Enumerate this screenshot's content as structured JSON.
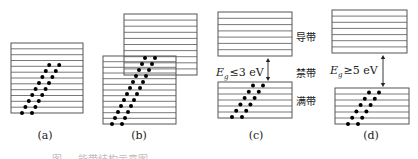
{
  "figure": {
    "line_color": "#555555",
    "dot_color": "#000000",
    "text_color": "#1a1a1a",
    "panels": [
      {
        "id": "a",
        "label": "(a)",
        "kind": "partially-filled band"
      },
      {
        "id": "b",
        "label": "(b)",
        "kind": "overlapping bands"
      },
      {
        "id": "c",
        "label": "(c)",
        "kind": "semiconductor",
        "gap_symbol": "E",
        "gap_subscript": "g",
        "gap_relation": "≤3 eV"
      },
      {
        "id": "d",
        "label": "(d)",
        "kind": "insulator",
        "gap_symbol": "E",
        "gap_subscript": "g",
        "gap_relation": "≥5 eV"
      }
    ],
    "band_labels": {
      "conduction": "导带",
      "forbidden": "禁带",
      "valence": "满带"
    },
    "caption": "图 … 能带结构示意图"
  }
}
